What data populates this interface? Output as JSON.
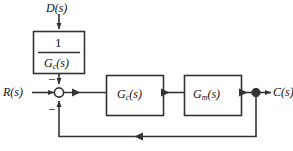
{
  "diagram": {
    "line_color": "#333333",
    "text_color": "#111111",
    "background": "#ffffff",
    "signals": {
      "disturbance": {
        "base": "D",
        "arg": "(s)"
      },
      "reference": {
        "base": "R",
        "arg": "(s)"
      },
      "output": {
        "base": "C",
        "arg": "(s)"
      }
    },
    "feedforward_block": {
      "numerator": "1",
      "denominator": {
        "base": "G",
        "sub": "c",
        "arg": "(s)"
      }
    },
    "controller_block": {
      "base": "G",
      "sub": "c",
      "arg": "(s)"
    },
    "plant_block": {
      "base": "G",
      "sub": "m",
      "arg": "(s)"
    },
    "summing_junction": {
      "sign_top": "−",
      "sign_bottom": "−"
    }
  }
}
